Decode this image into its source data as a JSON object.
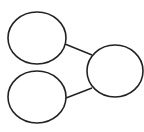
{
  "diagram": {
    "type": "node-link",
    "nodes": [
      {
        "id": "top-left",
        "label": ""
      },
      {
        "id": "bottom-left",
        "label": ""
      },
      {
        "id": "right",
        "label": ""
      }
    ],
    "edges": [
      {
        "from": "top-left",
        "to": "right"
      },
      {
        "from": "bottom-left",
        "to": "right"
      }
    ],
    "colors": {
      "stroke": "#222222",
      "fill": "#ffffff",
      "background": "#ffffff"
    }
  }
}
